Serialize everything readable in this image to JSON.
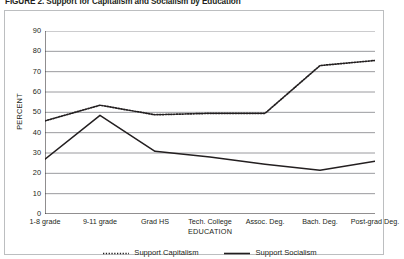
{
  "figure": {
    "title": "FIGURE 2. Support for Capitalism and Socialism by Education"
  },
  "chart_data": {
    "type": "line",
    "title": "FIGURE 2. Support for Capitalism and Socialism by Education",
    "xlabel": "EDUCATION",
    "ylabel": "PERCENT",
    "ylim": [
      0,
      90
    ],
    "yticks": [
      0,
      10,
      20,
      30,
      40,
      50,
      60,
      70,
      80,
      90
    ],
    "ytick_labels": [
      "0",
      "10",
      "20",
      "30",
      "40",
      "50",
      "60",
      "70",
      "80",
      "90"
    ],
    "grid": true,
    "legend_position": "bottom",
    "categories": [
      "1-8 grade",
      "9-11 grade",
      "Grad HS",
      "Tech. College",
      "Assoc. Deg.",
      "Bach. Deg.",
      "Post-grad Deg."
    ],
    "series": [
      {
        "name": "Support Capitalism",
        "style": "dotted",
        "color": "#231f20",
        "values": [
          45.8,
          53.5,
          48.8,
          49.5,
          49.5,
          73.0,
          75.5
        ]
      },
      {
        "name": "Support Socialism",
        "style": "solid",
        "color": "#231f20",
        "values": [
          27.0,
          48.5,
          30.8,
          28.0,
          24.5,
          21.5,
          26.0
        ]
      }
    ]
  },
  "legend": {
    "items": [
      {
        "label": "Support Capitalism",
        "style": "dotted"
      },
      {
        "label": "Support Socialism",
        "style": "solid"
      }
    ]
  },
  "colors": {
    "line": "#231f20",
    "grid": "#808285",
    "axis": "#231f20",
    "frame": "#bcbec0",
    "background": "#ffffff"
  }
}
